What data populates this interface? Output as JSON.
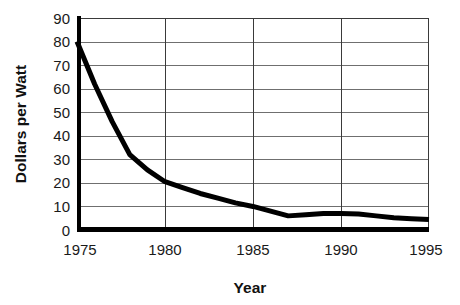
{
  "chart_data": {
    "type": "line",
    "title": "",
    "xlabel": "Year",
    "ylabel": "Dollars per Watt",
    "xlim": [
      1975,
      1995
    ],
    "ylim": [
      0,
      90
    ],
    "grid": "horizontal-and-vertical",
    "legend": "none",
    "x_ticks": [
      "1975",
      "1980",
      "1985",
      "1990",
      "1995"
    ],
    "x_tick_values": [
      1975,
      1980,
      1985,
      1990,
      1995
    ],
    "y_ticks": [
      "0",
      "10",
      "20",
      "30",
      "40",
      "50",
      "60",
      "70",
      "80",
      "90"
    ],
    "y_tick_values": [
      0,
      10,
      20,
      30,
      40,
      50,
      60,
      70,
      80,
      90
    ],
    "series": [
      {
        "name": "Dollars per Watt",
        "color": "#000000",
        "x": [
          1975,
          1976,
          1977,
          1978,
          1979,
          1980,
          1981,
          1982,
          1983,
          1984,
          1985,
          1986,
          1987,
          1988,
          1989,
          1990,
          1991,
          1992,
          1993,
          1994,
          1995
        ],
        "values": [
          80,
          62,
          46,
          32,
          25.5,
          20.5,
          18,
          15.5,
          13.5,
          11.5,
          10,
          8,
          6,
          6.5,
          7,
          7,
          6.8,
          6,
          5.2,
          4.8,
          4.5
        ]
      }
    ]
  },
  "axes": {
    "y_axis_title": "Dollars per Watt",
    "x_axis_title": "Year"
  },
  "colors": {
    "series": "#000000",
    "gridline": "#6f6f6f",
    "axis": "#000000",
    "background": "#ffffff"
  }
}
